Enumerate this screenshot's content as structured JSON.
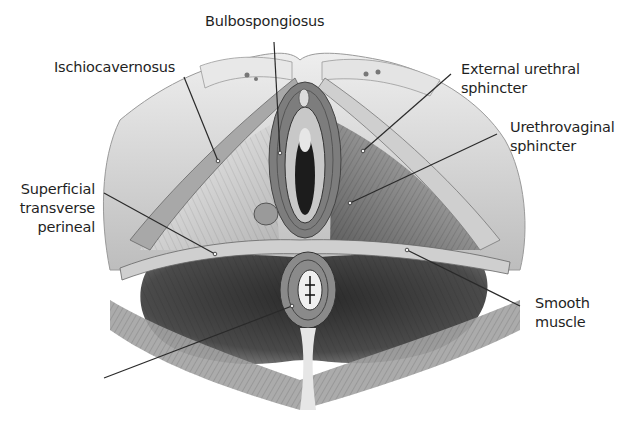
{
  "figure": {
    "style": "grayscale anatomical illustration",
    "colors": {
      "background": "#ffffff",
      "bone": "#d9d9d9",
      "muscle_dark": "#3a3a3a",
      "muscle_mid": "#7a7a7a",
      "leader_line": "#2a2a2a",
      "label_text": "#1f1f1f"
    }
  },
  "labels": [
    {
      "id": "ischiocavernosus",
      "lines": [
        "Ischiocavernosus"
      ]
    },
    {
      "id": "bulbospongiosus",
      "lines": [
        "Bulbospongiosus"
      ]
    },
    {
      "id": "external-urethral-sphincter",
      "lines": [
        "External urethral",
        "sphincter"
      ]
    },
    {
      "id": "urethrovaginal-sphincter",
      "lines": [
        "Urethrovaginal",
        "sphincter"
      ]
    },
    {
      "id": "superficial-transverse-perineal",
      "lines": [
        "Superficial",
        "transverse",
        "perineal"
      ]
    },
    {
      "id": "smooth-muscle",
      "lines": [
        "Smooth",
        "muscle"
      ]
    },
    {
      "id": "unlabeled-pointer",
      "lines": []
    }
  ]
}
